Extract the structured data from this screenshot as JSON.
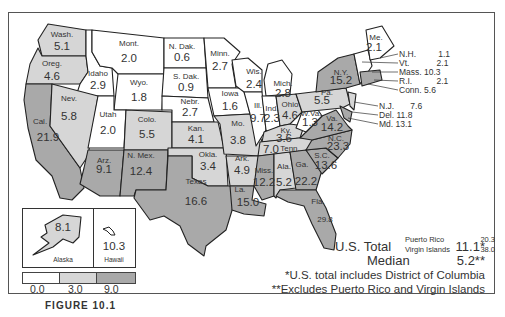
{
  "map": {
    "colors": {
      "low": "#ffffff",
      "mid": "#d6d6d6",
      "high": "#a9a9a9",
      "border": "#222222"
    },
    "states": {
      "wash": {
        "name": "Wash.",
        "value": "5.1"
      },
      "oreg": {
        "name": "Oreg.",
        "value": "4.6"
      },
      "cal": {
        "name": "Cal.",
        "value": "21.9"
      },
      "idaho": {
        "name": "Idaho",
        "value": "2.9"
      },
      "nev": {
        "name": "Nev.",
        "value": "5.8"
      },
      "mont": {
        "name": "Mont.",
        "value": "2.0"
      },
      "wyo": {
        "name": "Wyo.",
        "value": "1.8"
      },
      "utah": {
        "name": "Utah",
        "value": "2.0"
      },
      "colo": {
        "name": "Colo.",
        "value": "5.5"
      },
      "arz": {
        "name": "Arz.",
        "value": "9.1"
      },
      "nmex": {
        "name": "N. Mex.",
        "value": "12.4"
      },
      "ndak": {
        "name": "N. Dak.",
        "value": "0.6"
      },
      "sdak": {
        "name": "S. Dak.",
        "value": "0.9"
      },
      "nebr": {
        "name": "Nebr.",
        "value": "2.7"
      },
      "kan": {
        "name": "Kan.",
        "value": "4.1"
      },
      "okla": {
        "name": "Okla.",
        "value": "3.4"
      },
      "texas": {
        "name": "Texas",
        "value": "16.6"
      },
      "minn": {
        "name": "Minn.",
        "value": "2.7"
      },
      "iowa": {
        "name": "Iowa",
        "value": "1.6"
      },
      "mo": {
        "name": "Mo.",
        "value": "3.8"
      },
      "ark": {
        "name": "Ark.",
        "value": "4.9"
      },
      "la": {
        "name": "La.",
        "value": "15.0"
      },
      "wis": {
        "name": "Wis.",
        "value": "2.4"
      },
      "ill": {
        "name": "Ill.",
        "value": "9.7"
      },
      "mich": {
        "name": "Mich.",
        "value": "2.8"
      },
      "ind": {
        "name": "Ind.",
        "value": "2.3"
      },
      "ohio": {
        "name": "Ohio",
        "value": "4.6"
      },
      "ky": {
        "name": "Ky.",
        "value": "3.6"
      },
      "tenn": {
        "name": "Tenn.",
        "value": "7.0"
      },
      "miss": {
        "name": "Miss.",
        "value": "12.2"
      },
      "ala": {
        "name": "Ala.",
        "value": "5.2"
      },
      "ga": {
        "name": "Ga.",
        "value": "22.2"
      },
      "fla": {
        "name": "Fla.",
        "value": "29.8"
      },
      "sc": {
        "name": "S.C.",
        "value": "13.6"
      },
      "nc": {
        "name": "N.C.",
        "value": "23.3"
      },
      "va": {
        "name": "Va.",
        "value": "14.2"
      },
      "wva": {
        "name": "W.Va.",
        "value": "1.3"
      },
      "pa": {
        "name": "Pa.",
        "value": "5.5"
      },
      "ny": {
        "name": "N.Y.",
        "value": "15.2"
      },
      "me": {
        "name": "Me.",
        "value": "2.1"
      },
      "alaska": {
        "name": "Alaska",
        "value": "8.1"
      },
      "hawaii": {
        "name": "Hawaii",
        "value": "10.3"
      }
    },
    "callouts": [
      {
        "name": "N.H.",
        "value": "1.1"
      },
      {
        "name": "Vt.",
        "value": "2.1"
      },
      {
        "name": "Mass.",
        "value": "10.3"
      },
      {
        "name": "R.I.",
        "value": "2.1"
      },
      {
        "name": "Conn.",
        "value": "5.6"
      },
      {
        "name": "N.J.",
        "value": "7.6"
      },
      {
        "name": "Del.",
        "value": "11.8"
      },
      {
        "name": "Md.",
        "value": "13.1"
      }
    ],
    "territories": [
      {
        "name": "Puerto Rico",
        "value": "20.3"
      },
      {
        "name": "Virgin Islands",
        "value": "38.0"
      }
    ],
    "legend": {
      "ticks": [
        "0.0",
        "3.0",
        "9.0"
      ]
    },
    "summary": {
      "total_label": "U.S. Total",
      "total_value": "11.1*",
      "median_label": "Median",
      "median_value": "5.2**",
      "note1": "*U.S. total includes District of Columbia",
      "note2": "**Excludes Puerto Rico and Virgin Islands"
    },
    "caption": "FIGURE 10.1"
  }
}
